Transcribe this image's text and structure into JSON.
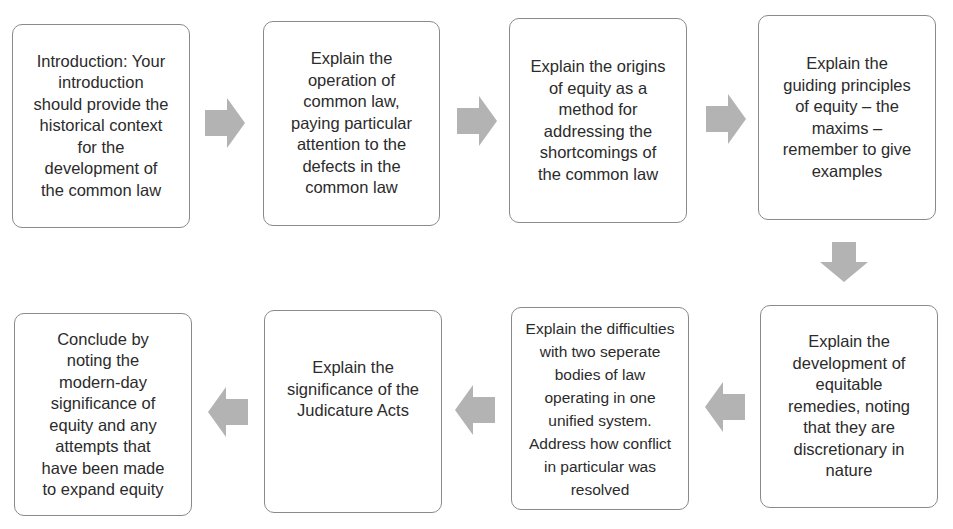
{
  "diagram": {
    "type": "flowchart",
    "arrow_color": "#b3b3b3",
    "border_color": "#8a8a8a",
    "steps": [
      {
        "id": 1,
        "text": "Introduction: Your\nintroduction\nshould provide the\nhistorical context\nfor the\ndevelopment of\nthe common law"
      },
      {
        "id": 2,
        "text": "Explain the\noperation of\ncommon law,\npaying particular\nattention to the\ndefects in the\ncommon law"
      },
      {
        "id": 3,
        "text": "Explain the origins\nof equity as a\nmethod for\naddressing the\nshortcomings of\nthe common law"
      },
      {
        "id": 4,
        "text": "Explain the\nguiding principles\nof equity – the\nmaxims –\nremember to give\nexamples"
      },
      {
        "id": 5,
        "text": "Explain the\ndevelopment of\nequitable\nremedies, noting\nthat they are\ndiscretionary in\nnature"
      },
      {
        "id": 6,
        "text": "Explain the difficulties\nwith two seperate\nbodies of law\noperating in one\nunified system.\nAddress how conflict\nin particular was\nresolved"
      },
      {
        "id": 7,
        "text": "Explain the\nsignificance of the\nJudicature Acts"
      },
      {
        "id": 8,
        "text": "Conclude by\nnoting the\nmodern-day\nsignificance of\nequity and any\nattempts that\nhave been made\nto expand equity"
      }
    ],
    "arrows": [
      {
        "from": 1,
        "to": 2,
        "direction": "right"
      },
      {
        "from": 2,
        "to": 3,
        "direction": "right"
      },
      {
        "from": 3,
        "to": 4,
        "direction": "right"
      },
      {
        "from": 4,
        "to": 5,
        "direction": "down"
      },
      {
        "from": 5,
        "to": 6,
        "direction": "left"
      },
      {
        "from": 6,
        "to": 7,
        "direction": "left"
      },
      {
        "from": 7,
        "to": 8,
        "direction": "left"
      }
    ]
  }
}
